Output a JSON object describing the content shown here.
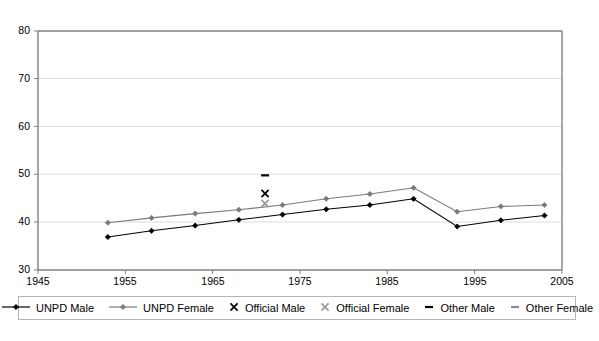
{
  "chart_data": {
    "type": "line",
    "title": "",
    "xlabel": "",
    "ylabel": "",
    "xlim": [
      1945,
      2005
    ],
    "ylim": [
      30,
      80
    ],
    "xticks": [
      1945,
      1955,
      1965,
      1975,
      1985,
      1995,
      2005
    ],
    "yticks": [
      30,
      40,
      50,
      60,
      70,
      80
    ],
    "grid": "horizontal",
    "legend_position": "bottom",
    "series": [
      {
        "name": "UNPD Male",
        "style": "line-marker",
        "marker": "diamond",
        "color": "#000000",
        "x": [
          1953,
          1958,
          1963,
          1968,
          1973,
          1978,
          1983,
          1988,
          1993,
          1998,
          2003
        ],
        "values": [
          36.9,
          38.2,
          39.3,
          40.5,
          41.6,
          42.7,
          43.6,
          44.9,
          39.1,
          40.4,
          41.4
        ]
      },
      {
        "name": "UNPD Female",
        "style": "line-marker",
        "marker": "diamond",
        "color": "#7a7a7a",
        "x": [
          1953,
          1958,
          1963,
          1968,
          1973,
          1978,
          1983,
          1988,
          1993,
          1998,
          2003
        ],
        "values": [
          39.9,
          40.9,
          41.8,
          42.6,
          43.6,
          44.9,
          45.9,
          47.2,
          42.2,
          43.3,
          43.6
        ]
      },
      {
        "name": "Official Male",
        "style": "marker-only",
        "marker": "x",
        "color": "#000000",
        "x": [
          1971
        ],
        "values": [
          46.0
        ]
      },
      {
        "name": "Official Female",
        "style": "marker-only",
        "marker": "x",
        "color": "#9a9a9a",
        "x": [
          1971
        ],
        "values": [
          43.9
        ]
      },
      {
        "name": "Other Male",
        "style": "marker-only",
        "marker": "dash",
        "color": "#000000",
        "x": [
          1971
        ],
        "values": [
          49.8
        ]
      },
      {
        "name": "Other Female",
        "style": "marker-only",
        "marker": "dash",
        "color": "#8a8a8a",
        "x": [],
        "values": []
      }
    ]
  },
  "axes": {
    "y_tick_labels": [
      "80",
      "70",
      "60",
      "50",
      "40",
      "30"
    ],
    "x_tick_labels": [
      "1945",
      "1955",
      "1965",
      "1975",
      "1985",
      "1995",
      "2005"
    ]
  },
  "legend": {
    "entries": [
      {
        "label": "UNPD Male",
        "key": "line-diamond",
        "color": "#000000"
      },
      {
        "label": "UNPD Female",
        "key": "line-diamond",
        "color": "#7a7a7a"
      },
      {
        "label": "Official Male",
        "key": "x",
        "color": "#000000"
      },
      {
        "label": "Official Female",
        "key": "x",
        "color": "#9a9a9a"
      },
      {
        "label": "Other Male",
        "key": "dash",
        "color": "#000000"
      },
      {
        "label": "Other Female",
        "key": "dash",
        "color": "#8a8a8a"
      }
    ]
  },
  "colors": {
    "plot_frame": "#808080",
    "gridline": "#d9d9d9",
    "background": "#ffffff",
    "text": "#000000"
  }
}
